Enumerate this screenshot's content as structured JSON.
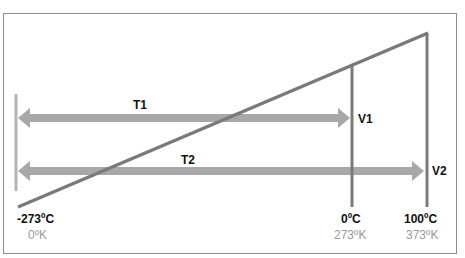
{
  "diagram": {
    "colors": {
      "frame": "#8c8c8c",
      "line": "#7a7a7a",
      "arrow": "#a8a8a8",
      "zero_bar": "#b4b4b4",
      "label_dark": "#111111",
      "label_light": "#9a9a9a"
    },
    "arrows": [
      {
        "id": "T1",
        "label": "T1",
        "end_label": "V1"
      },
      {
        "id": "T2",
        "label": "T2",
        "end_label": "V2"
      }
    ],
    "axis_labels": [
      {
        "celsius": "-273ºC",
        "kelvin": "0ºK"
      },
      {
        "celsius": "0ºC",
        "kelvin": "273ºK"
      },
      {
        "celsius": "100ºC",
        "kelvin": "373ºK"
      }
    ]
  }
}
